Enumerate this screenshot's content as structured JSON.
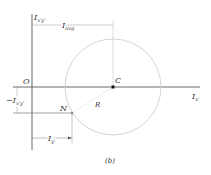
{
  "diagram": {
    "caption": "(b)",
    "axes": {
      "vertical_label": "I",
      "vertical_sub": "x'y'",
      "horizontal_label": "I",
      "horizontal_sub": "x'",
      "origin_label": "O"
    },
    "points": {
      "center_label": "C",
      "point_label": "N",
      "radius_label": "R"
    },
    "dimensions": {
      "avg_label": "I",
      "avg_sub": "avg",
      "neg_product_label": "−I",
      "neg_product_sub": "x'y'",
      "iy_label": "I",
      "iy_sub": "y'"
    },
    "colors": {
      "axis": "#444444",
      "circle": "#c8c8c8",
      "dimension": "#888888"
    }
  }
}
